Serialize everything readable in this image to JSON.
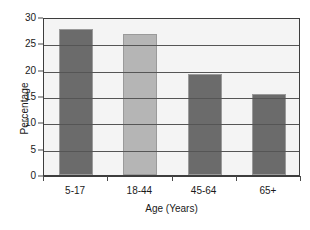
{
  "chart_data": {
    "type": "bar",
    "title": "",
    "subtitle": "",
    "categories": [
      "5-17",
      "18-44",
      "45-64",
      "65+"
    ],
    "values": [
      27.8,
      26.8,
      19.2,
      15.3
    ],
    "xlabel": "Age (Years)",
    "ylabel": "Percentage",
    "ylim": [
      0,
      30
    ],
    "ytick_labels": [
      "0",
      "5",
      "10",
      "15",
      "20",
      "25",
      "30"
    ],
    "ytick_values": [
      0,
      5,
      10,
      15,
      20,
      25,
      30
    ],
    "grid": "horizontal",
    "legend": "none",
    "bar_colors": [
      "#6b6b6b",
      "#b5b5b5",
      "#6b6b6b",
      "#6b6b6b"
    ],
    "plot_background": "#f4f4f4",
    "gridline_color": "#555555",
    "frame_color": "#3d3d3d",
    "bar_border_color": "#9a9a9a"
  }
}
